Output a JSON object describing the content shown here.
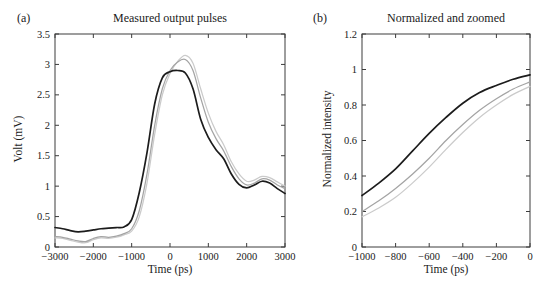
{
  "figure": {
    "background": "#ffffff",
    "frame_color": "#3c3c3c",
    "text_color": "#1a1a1a"
  },
  "chart_data": [
    {
      "panel": "a",
      "tag": "(a)",
      "type": "line",
      "title": "Measured output pulses",
      "xlabel": "Time (ps)",
      "ylabel": "Volt (mV)",
      "xlim": [
        -3000,
        3000
      ],
      "ylim": [
        0,
        3.5
      ],
      "grid": false,
      "legend": null,
      "xticks": [
        -3000,
        -2000,
        -1000,
        0,
        1000,
        2000,
        3000
      ],
      "xtick_labels": [
        "−3000",
        "−2000",
        "−1000",
        "0",
        "1000",
        "2000",
        "3000"
      ],
      "yticks": [
        0,
        0.5,
        1,
        1.5,
        2,
        2.5,
        3,
        3.5
      ],
      "ytick_labels": [
        "0",
        "0.5",
        "1",
        "1.5",
        "2",
        "2.5",
        "3",
        "3.5"
      ],
      "x": [
        -3000,
        -2800,
        -2600,
        -2400,
        -2200,
        -2000,
        -1800,
        -1600,
        -1400,
        -1200,
        -1000,
        -800,
        -600,
        -400,
        -200,
        0,
        200,
        400,
        600,
        800,
        1000,
        1200,
        1400,
        1600,
        1800,
        2000,
        2200,
        2400,
        2600,
        2800,
        3000
      ],
      "series": [
        {
          "name": "black-pulse",
          "color": "#1c1c1c",
          "width": 1.7,
          "values": [
            0.32,
            0.3,
            0.27,
            0.25,
            0.26,
            0.28,
            0.3,
            0.31,
            0.32,
            0.33,
            0.45,
            0.9,
            1.55,
            2.35,
            2.78,
            2.88,
            2.9,
            2.86,
            2.6,
            2.1,
            1.8,
            1.6,
            1.45,
            1.2,
            1.03,
            0.97,
            1.02,
            1.08,
            1.05,
            0.96,
            0.88
          ]
        },
        {
          "name": "gray-pulse",
          "color": "#a4a4a4",
          "width": 1.25,
          "values": [
            0.17,
            0.16,
            0.13,
            0.1,
            0.09,
            0.14,
            0.17,
            0.16,
            0.18,
            0.22,
            0.3,
            0.6,
            1.2,
            2.0,
            2.6,
            2.9,
            3.04,
            3.08,
            2.9,
            2.45,
            2.05,
            1.78,
            1.58,
            1.32,
            1.12,
            1.02,
            1.05,
            1.12,
            1.1,
            1.02,
            0.96
          ]
        },
        {
          "name": "light-gray-pulse",
          "color": "#cbcbcb",
          "width": 1.25,
          "values": [
            0.15,
            0.14,
            0.11,
            0.08,
            0.07,
            0.12,
            0.15,
            0.14,
            0.16,
            0.2,
            0.26,
            0.5,
            1.05,
            1.85,
            2.5,
            2.85,
            3.05,
            3.15,
            3.02,
            2.6,
            2.2,
            1.9,
            1.68,
            1.4,
            1.2,
            1.08,
            1.1,
            1.16,
            1.14,
            1.07,
            1.0
          ]
        }
      ]
    },
    {
      "panel": "b",
      "tag": "(b)",
      "type": "line",
      "title": "Normalized and zoomed",
      "xlabel": "Time (ps)",
      "ylabel": "Normalized intensity",
      "xlim": [
        -1000,
        0
      ],
      "ylim": [
        0,
        1.2
      ],
      "grid": false,
      "legend": null,
      "xticks": [
        -1000,
        -800,
        -600,
        -400,
        -200,
        0
      ],
      "xtick_labels": [
        "−1000",
        "−800",
        "−600",
        "−400",
        "−200",
        "0"
      ],
      "yticks": [
        0,
        0.2,
        0.4,
        0.6,
        0.8,
        1,
        1.2
      ],
      "ytick_labels": [
        "0",
        "0.2",
        "0.4",
        "0.6",
        "0.8",
        "1",
        "1.2"
      ],
      "x": [
        -1000,
        -900,
        -800,
        -700,
        -600,
        -500,
        -400,
        -300,
        -200,
        -100,
        0
      ],
      "series": [
        {
          "name": "black-rise",
          "color": "#1c1c1c",
          "width": 1.7,
          "values": [
            0.29,
            0.36,
            0.44,
            0.54,
            0.64,
            0.73,
            0.81,
            0.87,
            0.91,
            0.945,
            0.97
          ]
        },
        {
          "name": "gray-rise",
          "color": "#a4a4a4",
          "width": 1.25,
          "values": [
            0.2,
            0.26,
            0.33,
            0.41,
            0.5,
            0.6,
            0.69,
            0.77,
            0.835,
            0.89,
            0.93
          ]
        },
        {
          "name": "light-gray-rise",
          "color": "#cbcbcb",
          "width": 1.25,
          "values": [
            0.17,
            0.22,
            0.28,
            0.36,
            0.45,
            0.55,
            0.645,
            0.73,
            0.8,
            0.86,
            0.905
          ]
        }
      ]
    }
  ]
}
